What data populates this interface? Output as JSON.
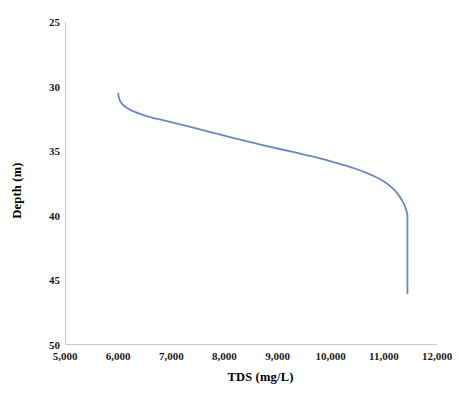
{
  "chart_data": {
    "type": "line",
    "title": "",
    "xlabel": "TDS (mg/L)",
    "ylabel": "Depth (m)",
    "xlim": [
      5000,
      12000
    ],
    "ylim": [
      25,
      50
    ],
    "y_inverted": true,
    "grid": false,
    "legend": "none",
    "xticks": [
      5000,
      6000,
      7000,
      8000,
      9000,
      10000,
      11000,
      12000
    ],
    "xtick_labels": [
      "5,000",
      "6,000",
      "7,000",
      "8,000",
      "9,000",
      "10,000",
      "11,000",
      "12,000"
    ],
    "yticks": [
      25,
      30,
      35,
      40,
      45,
      50
    ],
    "ytick_labels": [
      "25",
      "30",
      "35",
      "40",
      "45",
      "50"
    ],
    "line_color": "#6d87c0",
    "line_width": 1.8,
    "series": [
      {
        "name": "TDS profile",
        "x": [
          5985,
          5990,
          6010,
          6060,
          6130,
          6220,
          6330,
          6470,
          6640,
          6840,
          7070,
          7320,
          7590,
          7870,
          8160,
          8450,
          8740,
          9020,
          9290,
          9540,
          9780,
          10000,
          10210,
          10420,
          10620,
          10810,
          10990,
          11140,
          11260,
          11350,
          11400,
          11420,
          11425,
          11425,
          11425,
          11425
        ],
        "y": [
          30.55,
          30.75,
          31.05,
          31.35,
          31.6,
          31.82,
          32.02,
          32.22,
          32.42,
          32.62,
          32.85,
          33.1,
          33.38,
          33.68,
          33.98,
          34.28,
          34.56,
          34.83,
          35.08,
          35.32,
          35.56,
          35.8,
          36.05,
          36.32,
          36.62,
          36.96,
          37.36,
          37.84,
          38.4,
          39.0,
          39.52,
          39.88,
          40.1,
          42.0,
          44.0,
          46.0
        ]
      }
    ]
  },
  "axes": {
    "y_title": "Depth (m)",
    "x_title": "TDS (mg/L)",
    "y_labels": [
      "25",
      "30",
      "35",
      "40",
      "45",
      "50"
    ],
    "x_labels": [
      "5,000",
      "6,000",
      "7,000",
      "8,000",
      "9,000",
      "10,000",
      "11,000",
      "12,000"
    ]
  }
}
